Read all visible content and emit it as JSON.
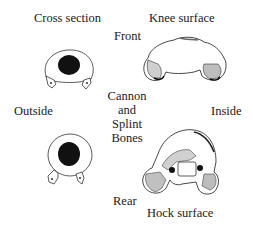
{
  "labels": {
    "cross_section": "Cross section",
    "knee_surface": "Knee surface",
    "front": "Front",
    "outside": "Outside",
    "inside": "Inside",
    "center_line1": "Cannon",
    "center_line2": "and",
    "center_line3": "Splint",
    "center_line4": "Bones",
    "rear": "Rear",
    "hock_surface": "Hock surface"
  },
  "figures": [
    {
      "name": "cross-section-top",
      "description": "cannon bone cross section with two splint bones (front view)"
    },
    {
      "name": "knee-surface",
      "description": "knee articular surface of cannon bone"
    },
    {
      "name": "cross-section-bottom",
      "description": "cannon bone cross section with two splint bones (rear view)"
    },
    {
      "name": "hock-surface",
      "description": "hock articular surface of cannon bone"
    }
  ],
  "colors": {
    "ink": "#1a1a1a",
    "marrow": "#111111",
    "background": "#ffffff"
  }
}
